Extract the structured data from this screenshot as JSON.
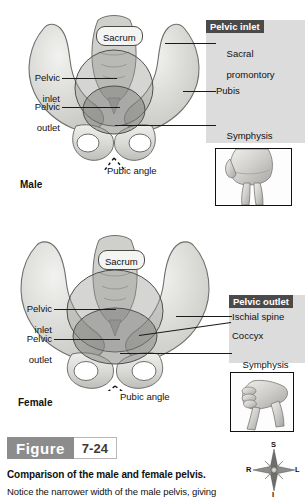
{
  "figure": {
    "word": "Figure",
    "number": "7-24",
    "caption_title": "Comparison of the male and female pelvis.",
    "caption_body": "Notice the narrower width of the male pelvis, giving"
  },
  "male": {
    "sex_label": "Male",
    "sacrum_label": "Sacrum",
    "pubic_angle_label": "Pubic angle",
    "left_labels": [
      {
        "line1": "Pelvic",
        "line2": "inlet"
      },
      {
        "line1": "Pelvic",
        "line2": "outlet"
      }
    ],
    "panel": {
      "header": "Pelvic inlet",
      "items": [
        {
          "line1": "Sacral",
          "line2": "promontory"
        },
        {
          "line1": "Pubis",
          "line2": ""
        },
        {
          "line1": "Symphysis",
          "line2": "pubis"
        }
      ]
    },
    "hand_inset_name": "narrow-angle-hand"
  },
  "female": {
    "sex_label": "Female",
    "sacrum_label": "Sacrum",
    "pubic_angle_label": "Pubic angle",
    "left_labels": [
      {
        "line1": "Pelvic",
        "line2": "inlet"
      },
      {
        "line1": "Pelvic",
        "line2": "outlet"
      }
    ],
    "panel": {
      "header": "Pelvic outlet",
      "items": [
        {
          "line1": "Ischial spine",
          "line2": ""
        },
        {
          "line1": "Coccyx",
          "line2": ""
        },
        {
          "line1": "Symphysis",
          "line2": "pubis"
        }
      ]
    },
    "hand_inset_name": "wide-angle-hand"
  },
  "compass": {
    "superior": "S",
    "inferior": "I",
    "right": "R",
    "left": "L"
  },
  "colors": {
    "panel_background": "#dcdcdc",
    "panel_header_background": "#4a4a4a",
    "panel_header_text": "#ffffff",
    "figure_tag_background": "#8c8c8c",
    "bone_light": "#e3e3e0",
    "bone_mid": "#c9c9c5",
    "bone_shadow": "#a9a9a5",
    "inlet_overlay": "#9a9a98",
    "outlet_overlay": "#878785",
    "leader_line": "#1a1a1a",
    "text": "#111111"
  }
}
